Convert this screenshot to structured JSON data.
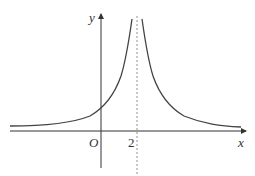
{
  "diagram": {
    "type": "function-graph",
    "axes": {
      "x_label": "x",
      "y_label": "y",
      "origin_label": "O"
    },
    "ticks": [
      {
        "axis": "x",
        "label": "2"
      }
    ],
    "asymptote": {
      "type": "vertical",
      "x": 2,
      "style": "dashed"
    },
    "curve": {
      "description": "symmetric about x=2, rises to +infinity near x=2, approaches x-axis as x goes to ±infinity"
    },
    "colors": {
      "stroke": "#444444",
      "dashed": "#777777"
    }
  }
}
